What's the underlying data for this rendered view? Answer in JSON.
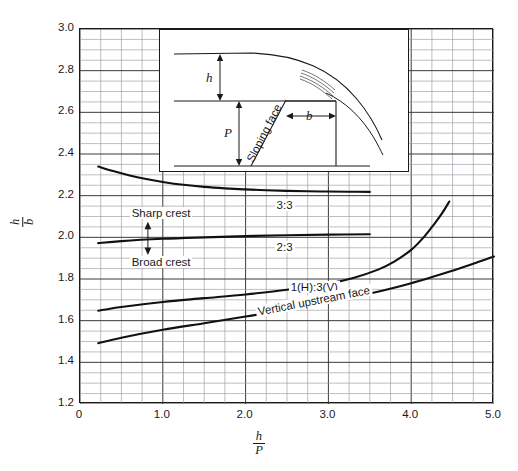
{
  "figure": {
    "cut_title": "",
    "inset": {
      "labels": {
        "head": "h",
        "height": "P",
        "crest_width": "b",
        "face": "Sloping face"
      }
    }
  },
  "chart_data": {
    "type": "line",
    "title": "",
    "xlabel_num": "h",
    "xlabel_den": "P",
    "ylabel_num": "h",
    "ylabel_den": "b",
    "xlim": [
      0,
      5.0
    ],
    "ylim": [
      1.2,
      3.0
    ],
    "grid": true,
    "x_major_ticks": [
      "0",
      "1.0",
      "2.0",
      "3.0",
      "4.0",
      "5.0"
    ],
    "x_major_values": [
      0,
      1.0,
      2.0,
      3.0,
      4.0,
      5.0
    ],
    "x_minor_step": 0.25,
    "y_major_ticks": [
      "1.2",
      "1.4",
      "1.6",
      "1.8",
      "2.0",
      "2.2",
      "2.4",
      "2.6",
      "2.8",
      "3.0"
    ],
    "y_major_values": [
      1.2,
      1.4,
      1.6,
      1.8,
      2.0,
      2.2,
      2.4,
      2.6,
      2.8,
      3.0
    ],
    "y_minor_step": 0.05,
    "legend_position": "inline-labels",
    "series": [
      {
        "name": "3:3",
        "label": "3:3",
        "label_x": 2.35,
        "label_y": 2.155,
        "points": [
          [
            0.22,
            2.34
          ],
          [
            0.4,
            2.318
          ],
          [
            0.6,
            2.297
          ],
          [
            0.8,
            2.28
          ],
          [
            1.0,
            2.266
          ],
          [
            1.25,
            2.252
          ],
          [
            1.5,
            2.242
          ],
          [
            1.75,
            2.235
          ],
          [
            2.0,
            2.23
          ],
          [
            2.25,
            2.226
          ],
          [
            2.5,
            2.223
          ],
          [
            2.75,
            2.221
          ],
          [
            3.0,
            2.22
          ],
          [
            3.25,
            2.219
          ],
          [
            3.5,
            2.218
          ]
        ]
      },
      {
        "name": "2:3",
        "label": "2:3",
        "label_x": 2.35,
        "label_y": 1.955,
        "points": [
          [
            0.22,
            1.972
          ],
          [
            0.5,
            1.982
          ],
          [
            1.0,
            1.993
          ],
          [
            1.5,
            2.0
          ],
          [
            2.0,
            2.006
          ],
          [
            2.5,
            2.01
          ],
          [
            3.0,
            2.013
          ],
          [
            3.5,
            2.015
          ]
        ]
      },
      {
        "name": "1(H):3(V)",
        "label": "1(H):3(V)",
        "label_x": 2.52,
        "label_y": 1.76,
        "points": [
          [
            0.22,
            1.648
          ],
          [
            0.5,
            1.666
          ],
          [
            1.0,
            1.69
          ],
          [
            1.5,
            1.708
          ],
          [
            2.0,
            1.726
          ],
          [
            2.5,
            1.748
          ],
          [
            3.0,
            1.778
          ],
          [
            3.3,
            1.805
          ],
          [
            3.6,
            1.845
          ],
          [
            3.8,
            1.885
          ],
          [
            4.0,
            1.94
          ],
          [
            4.15,
            2.0
          ],
          [
            4.28,
            2.065
          ],
          [
            4.38,
            2.12
          ],
          [
            4.46,
            2.172
          ]
        ]
      },
      {
        "name": "Vertical upstream face",
        "label": "Vertical upstream face",
        "label_x": 2.13,
        "label_y": 1.64,
        "label_rotated": true,
        "points": [
          [
            0.22,
            1.492
          ],
          [
            0.5,
            1.518
          ],
          [
            1.0,
            1.556
          ],
          [
            1.5,
            1.588
          ],
          [
            2.0,
            1.62
          ],
          [
            2.5,
            1.652
          ],
          [
            3.0,
            1.688
          ],
          [
            3.5,
            1.73
          ],
          [
            4.0,
            1.78
          ],
          [
            4.5,
            1.84
          ],
          [
            4.8,
            1.88
          ],
          [
            5.0,
            1.908
          ]
        ]
      }
    ],
    "annotations": [
      {
        "text": "Sharp crest",
        "x": 0.6,
        "y": 2.115
      },
      {
        "text": "Broad crest",
        "x": 0.6,
        "y": 1.88
      },
      {
        "text": "",
        "type": "double-arrow",
        "x": 0.82,
        "y_top": 2.075,
        "y_bottom": 1.915
      }
    ]
  }
}
